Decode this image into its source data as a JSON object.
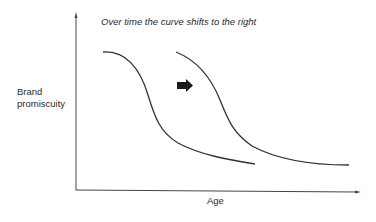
{
  "diagram": {
    "title": "Over time the curve shifts to the right",
    "y_axis_label_line1": "Brand",
    "y_axis_label_line2": "promiscuity",
    "x_axis_label": "Age",
    "shift_arrow": "right-arrow-icon",
    "curves": [
      {
        "name": "current-curve",
        "start": [
          103,
          52
        ],
        "end": [
          255,
          164
        ]
      },
      {
        "name": "shifted-curve",
        "start": [
          176,
          52
        ],
        "end": [
          349,
          165
        ]
      }
    ],
    "line_color": "#333333"
  }
}
